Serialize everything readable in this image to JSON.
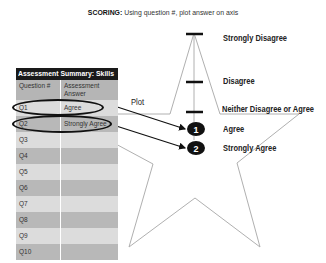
{
  "instruction": {
    "prefix": "SCORING:",
    "text": " Using question #, plot answer on axis"
  },
  "axis": {
    "labels": [
      {
        "text": "Strongly Disagree",
        "y": 37
      },
      {
        "text": "Disagree",
        "y": 78
      },
      {
        "text": "Neither Disagree or Agree",
        "y": 110
      },
      {
        "text": "Agree",
        "y": 130
      },
      {
        "text": "Strongly Agree",
        "y": 148
      }
    ]
  },
  "plot_label": "Plot",
  "markers": [
    {
      "number": "1",
      "x": 196,
      "y": 129
    },
    {
      "number": "2",
      "x": 196,
      "y": 148
    }
  ],
  "table": {
    "title": "Assessment Summary: Skills",
    "headers": [
      "Question #",
      "Assessment Answer"
    ],
    "rows": [
      {
        "q": "Q1",
        "a": "Agree"
      },
      {
        "q": "Q2",
        "a": "Strongly Agree"
      },
      {
        "q": "Q3",
        "a": ""
      },
      {
        "q": "Q4",
        "a": ""
      },
      {
        "q": "Q5",
        "a": ""
      },
      {
        "q": "Q6",
        "a": ""
      },
      {
        "q": "Q7",
        "a": ""
      },
      {
        "q": "Q8",
        "a": ""
      },
      {
        "q": "Q9",
        "a": ""
      },
      {
        "q": "Q10",
        "a": ""
      }
    ]
  },
  "colors": {
    "star_line": "#b0b0b0",
    "marker": "#111111",
    "table_title_bg": "#1a1a1a",
    "row_light": "#dcdcdc",
    "row_dark": "#b8b8b8"
  }
}
